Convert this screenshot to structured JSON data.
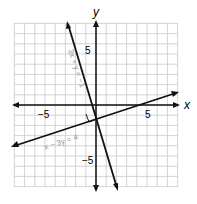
{
  "chart_data": {
    "type": "line",
    "title": "",
    "xlabel": "x",
    "ylabel": "y",
    "xlim": [
      -8,
      8
    ],
    "ylim": [
      -8,
      8
    ],
    "grid": true,
    "x_tick_labels": [
      "-5",
      "5"
    ],
    "y_tick_labels": [
      "5",
      "-5"
    ],
    "series": [
      {
        "name": "3x + y = -1",
        "equation": "y = -3x - 1",
        "points": [
          [
            -3,
            8
          ],
          [
            2.3,
            -7.9
          ]
        ]
      },
      {
        "name": "x - 3y = 4",
        "equation": "y = (x - 4)/3",
        "points": [
          [
            -8,
            -4
          ],
          [
            8,
            1.33
          ]
        ]
      }
    ],
    "annotations": [
      "3x + y = −1",
      "x − 3y = 4",
      "right-angle marker at intersection"
    ]
  },
  "labels": {
    "x": "x",
    "y": "y",
    "xneg": "−5",
    "xpos": "5",
    "ypos": "5",
    "yneg": "−5",
    "eq1": "3x + y = −1",
    "eq2": "x − 3y = 4"
  }
}
